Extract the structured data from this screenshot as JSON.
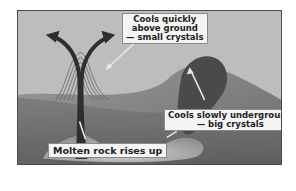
{
  "diagram": {
    "type": "igneous-rock-formation",
    "labels": {
      "extrusive": {
        "line1": "Cools quickly",
        "line2": "above ground",
        "line3": "— small crystals"
      },
      "intrusive": {
        "line1": "Cools slowly underground",
        "line2": "— big crystals"
      },
      "magma": {
        "line1": "Molten rock rises up"
      }
    },
    "colors": {
      "sky": "#bdbdbd",
      "hill": "#8c8c8c",
      "ground": "#6e6e6e",
      "intrusion": "#4a4a4a",
      "magma_chamber": "#a8a8a8",
      "vent": "#2e2e2e",
      "label_bg": "#f4f4f4",
      "border": "#4a4a4a"
    }
  }
}
